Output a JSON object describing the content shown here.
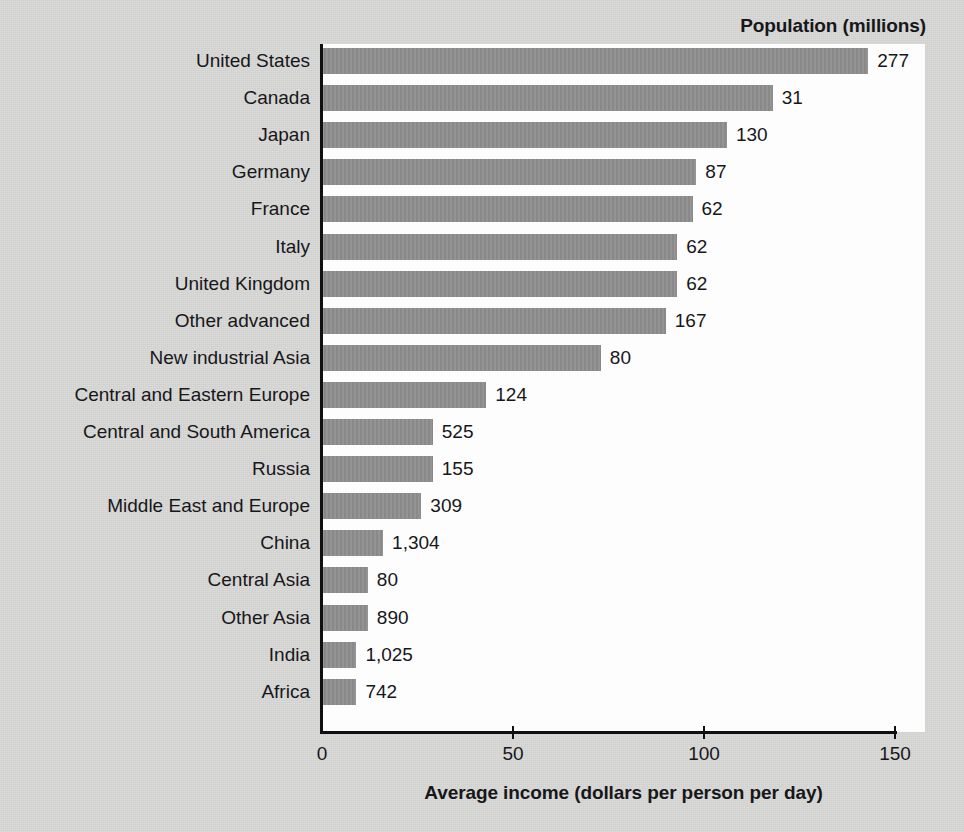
{
  "chart_data": {
    "type": "bar",
    "orientation": "horizontal",
    "title": "Population (millions)",
    "xlabel": "Average income (dollars per person per day)",
    "ylabel": "",
    "xlim": [
      0,
      150
    ],
    "xticks": [
      0,
      50,
      100,
      150
    ],
    "xtick_labels": [
      "0",
      "50",
      "100",
      "150"
    ],
    "grid": false,
    "legend": "none",
    "bar_color": "#8e8e8e",
    "plot_background": "#fdfdfd",
    "figure_background": "#d7d7d6",
    "text_color": "#17171a",
    "value_label_note": "Numbers at the end of each bar are the population in millions (the series named in the top-right title).",
    "categories": [
      "United States",
      "Canada",
      "Japan",
      "Germany",
      "France",
      "Italy",
      "United Kingdom",
      "Other advanced",
      "New industrial Asia",
      "Central and Eastern Europe",
      "Central and South America",
      "Russia",
      "Middle East and Europe",
      "China",
      "Central Asia",
      "Other Asia",
      "India",
      "Africa"
    ],
    "values": [
      143,
      118,
      106,
      98,
      97,
      93,
      93,
      90,
      73,
      43,
      29,
      29,
      26,
      16,
      12,
      12,
      9,
      9
    ],
    "point_labels": [
      "277",
      "31",
      "130",
      "87",
      "62",
      "62",
      "62",
      "167",
      "80",
      "124",
      "525",
      "155",
      "309",
      "1,304",
      "80",
      "890",
      "1,025",
      "742"
    ],
    "series": [
      {
        "name": "Average income (dollars per person per day)",
        "values": [
          143,
          118,
          106,
          98,
          97,
          93,
          93,
          90,
          73,
          43,
          29,
          29,
          26,
          16,
          12,
          12,
          9,
          9
        ]
      },
      {
        "name": "Population (millions)",
        "values": [
          277,
          31,
          130,
          87,
          62,
          62,
          62,
          167,
          80,
          124,
          525,
          155,
          309,
          1304,
          80,
          890,
          1025,
          742
        ]
      }
    ]
  }
}
